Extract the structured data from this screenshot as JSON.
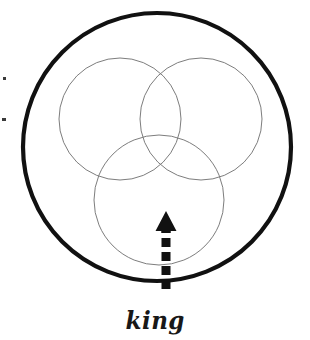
{
  "figure": {
    "title": "king",
    "caption": "king",
    "canvas": {
      "width": 310,
      "height": 340,
      "background": "#ffffff"
    },
    "outer_circle": {
      "name": "universe-circle",
      "cx": 157,
      "cy": 147,
      "r": 134,
      "stroke": "#111111",
      "stroke_width": 4.2,
      "fill": "none"
    },
    "inner_circles": [
      {
        "name": "set-circle-top-left",
        "position": "top-left",
        "cx": 120,
        "cy": 119,
        "r": 61,
        "stroke": "#7d7d7d",
        "stroke_width": 1,
        "fill": "none"
      },
      {
        "name": "set-circle-top-right",
        "position": "top-right",
        "cx": 201,
        "cy": 119,
        "r": 61,
        "stroke": "#7d7d7d",
        "stroke_width": 1,
        "fill": "none"
      },
      {
        "name": "set-circle-bottom",
        "position": "bottom-center",
        "cx": 159,
        "cy": 200,
        "r": 65,
        "stroke": "#7d7d7d",
        "stroke_width": 1,
        "fill": "none"
      }
    ],
    "arrow": {
      "name": "dashed-up-arrow",
      "direction": "up",
      "x": 166,
      "tail_y": 289,
      "head_tip_y": 211,
      "shaft_width": 9,
      "head_width": 21,
      "head_height": 20,
      "dash_pattern": "9 5",
      "color": "#111111",
      "points_to": "bottom-center region inside bottom set circle"
    },
    "artifacts": [
      {
        "name": "scan-speck-upper-left",
        "x": 3,
        "y": 77,
        "w": 3,
        "h": 3,
        "color": "#3a3a3a"
      },
      {
        "name": "scan-speck-lower-left",
        "x": 2,
        "y": 118,
        "w": 4,
        "h": 3,
        "color": "#3a3a3a"
      }
    ]
  },
  "colors": {
    "outer_stroke": "#111111",
    "inner_stroke": "#7d7d7d",
    "arrow": "#111111",
    "caption": "#181818",
    "background": "#ffffff"
  }
}
